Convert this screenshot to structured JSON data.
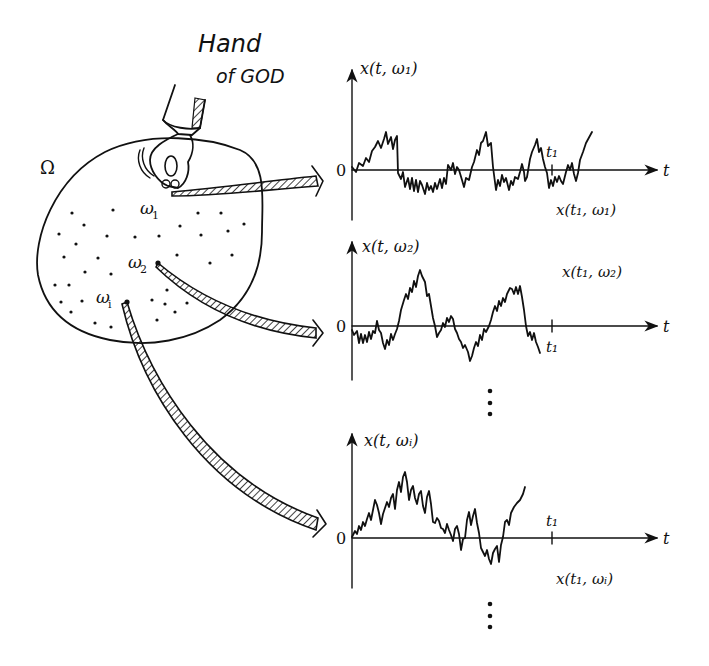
{
  "caption": {
    "line1": "Hand",
    "line2": "of GOD"
  },
  "sample_space": {
    "label": "Ω",
    "points": [
      {
        "id": "omega1",
        "label": "ω",
        "sub": "1"
      },
      {
        "id": "omega2",
        "label": "ω",
        "sub": "2"
      },
      {
        "id": "omegai",
        "label": "ω",
        "sub": "i"
      }
    ]
  },
  "plots": [
    {
      "y_label": "x(t, ω₁)",
      "x_label": "t",
      "origin_label": "0",
      "tick_label": "t₁",
      "value_label": "x(t₁, ω₁)"
    },
    {
      "y_label": "x(t, ω₂)",
      "x_label": "t",
      "origin_label": "0",
      "tick_label": "t₁",
      "value_label": "x(t₁, ω₂)"
    },
    {
      "y_label": "x(t, ωᵢ)",
      "x_label": "t",
      "origin_label": "0",
      "tick_label": "t₁",
      "value_label": "x(t₁, ωᵢ)"
    }
  ],
  "ellipsis": "⋮",
  "colors": {
    "ink": "#111111",
    "background": "#ffffff"
  }
}
